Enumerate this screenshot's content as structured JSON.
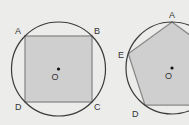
{
  "colors": {
    "background": "#ececeb",
    "circle_stroke": "#3a3a3a",
    "polygon_fill": "#cfcfcf",
    "polygon_stroke": "#8a8a8a",
    "center_dot": "#111111"
  },
  "figures": [
    {
      "name": "inscribed-square",
      "center": {
        "x": 58.5,
        "y": 69,
        "label": "O"
      },
      "radius": 47,
      "vertices": [
        {
          "label": "A",
          "x": 25,
          "y": 36
        },
        {
          "label": "B",
          "x": 92,
          "y": 36
        },
        {
          "label": "C",
          "x": 92,
          "y": 102
        },
        {
          "label": "D",
          "x": 25,
          "y": 102
        }
      ]
    },
    {
      "name": "inscribed-pentagon",
      "center": {
        "x": 172,
        "y": 68,
        "label": "O"
      },
      "radius": 46,
      "vertices": [
        {
          "label": "A",
          "x": 172,
          "y": 22
        },
        {
          "label": "B",
          "x": 215.7,
          "y": 53.8
        },
        {
          "label": "C",
          "x": 199,
          "y": 105.2
        },
        {
          "label": "D",
          "x": 145,
          "y": 105.2
        },
        {
          "label": "E",
          "x": 128.3,
          "y": 53.8
        }
      ]
    }
  ],
  "labels": {
    "sq_A": "A",
    "sq_B": "B",
    "sq_C": "C",
    "sq_D": "D",
    "sq_O": "O",
    "pe_A": "A",
    "pe_E": "E",
    "pe_D": "D",
    "pe_O": "O"
  }
}
